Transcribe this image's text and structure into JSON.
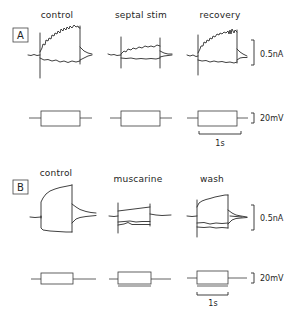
{
  "figure": {
    "panels": [
      {
        "id": "A",
        "label": "A",
        "conditions": [
          {
            "label": "control"
          },
          {
            "label": "septal stim"
          },
          {
            "label": "recovery"
          }
        ],
        "current_scale": "0.5nA",
        "voltage_scale": "20mV",
        "time_scale": "1s"
      },
      {
        "id": "B",
        "label": "B",
        "conditions": [
          {
            "label": "control"
          },
          {
            "label": "muscarine"
          },
          {
            "label": "wash"
          }
        ],
        "current_scale": "0.5nA",
        "voltage_scale": "20mV",
        "time_scale": "1s"
      }
    ],
    "colors": {
      "ink": "#2b2b2b",
      "background": "#ffffff"
    }
  }
}
